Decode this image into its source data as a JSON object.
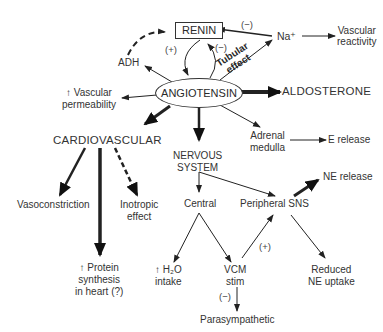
{
  "nodes": {
    "renin": "RENIN",
    "angiotensin": "ANGIOTENSIN",
    "adh": "ADH",
    "na": "Na⁺",
    "vascular_reactivity": [
      "Vascular",
      "reactivity"
    ],
    "vascular_permeability": [
      "↑ Vascular",
      "permeability"
    ],
    "aldosterone": "ALDOSTERONE",
    "cardiovascular": "CARDIOVASCULAR",
    "adrenal_medulla": [
      "Adrenal",
      "medulla"
    ],
    "e_release": "E release",
    "nervous_system": [
      "NERVOUS",
      "SYSTEM"
    ],
    "vasoconstriction": "Vasoconstriction",
    "inotropic_effect": [
      "Inotropic",
      "effect"
    ],
    "central": "Central",
    "peripheral_sns": "Peripheral SNS",
    "ne_release": "NE release",
    "protein_synthesis": [
      "↑ Protein",
      "synthesis",
      "in heart (?)"
    ],
    "h2o_intake": [
      "↑ H₂O",
      "intake"
    ],
    "vcm_stim": [
      "VCM",
      "stim"
    ],
    "reduced_ne_uptake": [
      "Reduced",
      "NE uptake"
    ],
    "parasympathetic": "Parasympathetic"
  },
  "edge_labels": {
    "renin_to_angio_plus": "(+)",
    "angio_to_renin_minus": "(−)",
    "na_to_renin_minus": "(−)",
    "tubular_effect": [
      "Tubular",
      "effect"
    ],
    "vcm_to_peripheral_plus": "(+)",
    "vcm_to_parasym_minus": "(−)"
  }
}
